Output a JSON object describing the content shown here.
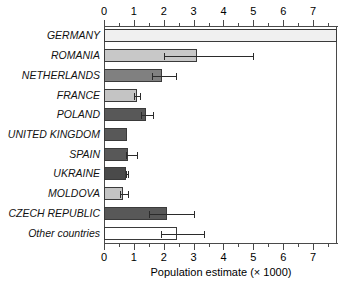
{
  "chart_data": {
    "type": "bar",
    "orientation": "horizontal",
    "title": "",
    "xlabel": "Population estimate (× 1000)",
    "ylabel": "",
    "xlim": [
      0,
      7.8
    ],
    "xticks": [
      0,
      1,
      2,
      3,
      4,
      5,
      6,
      7
    ],
    "xticklabels": [
      "0",
      "1",
      "2",
      "3",
      "4",
      "5",
      "6",
      "7"
    ],
    "minor_tick_step": 0.5,
    "axis_top": true,
    "axis_bottom": true,
    "grid": false,
    "legend": "none",
    "categories": [
      "GERMANY",
      "ROMANIA",
      "NETHERLANDS",
      "FRANCE",
      "POLAND",
      "UNITED KINGDOM",
      "SPAIN",
      "UKRAINE",
      "MOLDOVA",
      "CZECH REPUBLIC",
      "Other countries"
    ],
    "values": [
      7.8,
      3.1,
      1.95,
      1.1,
      1.42,
      0.78,
      0.82,
      0.75,
      0.62,
      2.1,
      2.45
    ],
    "err_low": [
      null,
      2.0,
      1.6,
      1.0,
      1.25,
      null,
      0.75,
      0.72,
      0.55,
      1.5,
      1.9
    ],
    "err_high": [
      null,
      5.0,
      2.4,
      1.2,
      1.63,
      null,
      1.1,
      0.82,
      0.8,
      3.0,
      3.35
    ],
    "bar_colors": [
      "#f0f0f0",
      "#c8c8c8",
      "#808080",
      "#c4c4c4",
      "#585858",
      "#585858",
      "#585858",
      "#4a4a4a",
      "#c4c4c4",
      "#585858",
      "#ffffff"
    ],
    "bar_edge_color": "#3a3a3a",
    "error_color": "#2b2b2b"
  }
}
